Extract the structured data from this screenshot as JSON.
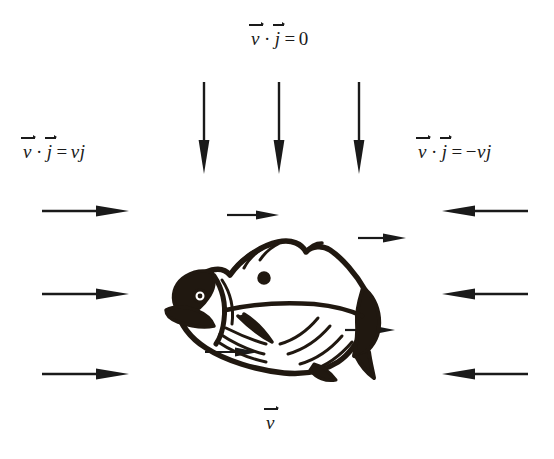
{
  "figure": {
    "background_color": "#ffffff",
    "ink_color": "#1a1a1a",
    "width": 554,
    "height": 459
  },
  "labels": {
    "top": {
      "id": "flux-top",
      "text": "v⃗ · j⃗ = 0",
      "vector_1": "v",
      "dot": "·",
      "vector_2": "j",
      "equals": "=",
      "value": "0",
      "x": 250,
      "y": 28
    },
    "left": {
      "id": "flux-left",
      "text": "v⃗ · j⃗ = vj",
      "vector_1": "v",
      "dot": "·",
      "vector_2": "j",
      "equals": "=",
      "value": "vj",
      "x": 22,
      "y": 141
    },
    "right": {
      "id": "flux-right",
      "text": "v⃗ · j⃗ = −vj",
      "vector_1": "v",
      "dot": "·",
      "vector_2": "j",
      "equals": "=",
      "value": "−vj",
      "minus": "−",
      "magnitude": "vj",
      "x": 417,
      "y": 141
    },
    "bottom": {
      "id": "velocity-vector",
      "text": "v⃗",
      "vector_1": "v",
      "x": 265,
      "y": 412
    }
  },
  "arrows": {
    "down_top": [
      {
        "name": "down-arrow-1",
        "x": 197,
        "y": 82,
        "length": 90,
        "direction": "down"
      },
      {
        "name": "down-arrow-2",
        "x": 272,
        "y": 82,
        "length": 90,
        "direction": "down"
      },
      {
        "name": "down-arrow-3",
        "x": 352,
        "y": 82,
        "length": 90,
        "direction": "down"
      }
    ],
    "right_left_side": [
      {
        "name": "right-arrow-1",
        "x": 42,
        "y": 211,
        "length": 85,
        "direction": "right"
      },
      {
        "name": "right-arrow-2",
        "x": 42,
        "y": 294,
        "length": 85,
        "direction": "right"
      },
      {
        "name": "right-arrow-3",
        "x": 42,
        "y": 374,
        "length": 85,
        "direction": "right"
      }
    ],
    "left_right_side": [
      {
        "name": "left-arrow-1",
        "x": 442,
        "y": 211,
        "length": 84,
        "direction": "left"
      },
      {
        "name": "left-arrow-2",
        "x": 442,
        "y": 294,
        "length": 84,
        "direction": "left"
      },
      {
        "name": "left-arrow-3",
        "x": 442,
        "y": 374,
        "length": 84,
        "direction": "left"
      }
    ],
    "near_fish": [
      {
        "name": "fish-arrow-top-left",
        "x": 227,
        "y": 215,
        "length": 50,
        "direction": "right"
      },
      {
        "name": "fish-arrow-top-right",
        "x": 358,
        "y": 238,
        "length": 46,
        "direction": "right"
      },
      {
        "name": "fish-arrow-bottom-right",
        "x": 345,
        "y": 330,
        "length": 48,
        "direction": "right"
      },
      {
        "name": "fish-arrow-bottom-left",
        "x": 205,
        "y": 352,
        "length": 52,
        "direction": "right"
      }
    ]
  },
  "illustration": {
    "name": "fish-drawing",
    "description": "Hand-drawn rough sketch of a fish facing left with dorsal fin, pectoral fin, gill, eye and tail fin"
  }
}
